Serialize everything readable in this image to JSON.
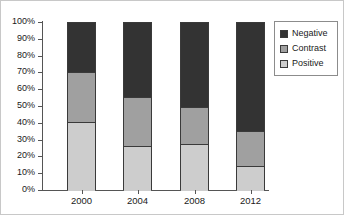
{
  "chart_data": {
    "type": "bar",
    "subtype": "stacked-percentage-column",
    "title": "",
    "subtitle": "",
    "xlabel": "",
    "ylabel": "",
    "categories": [
      "2000",
      "2004",
      "2008",
      "2012"
    ],
    "series": [
      {
        "name": "Positive",
        "color": "#cdcdcd",
        "values": [
          41,
          27,
          28,
          15
        ]
      },
      {
        "name": "Contrast",
        "color": "#a0a0a0",
        "values": [
          30,
          29,
          22,
          21
        ]
      },
      {
        "name": "Negative",
        "color": "#333333",
        "values": [
          29,
          44,
          50,
          64
        ]
      }
    ],
    "stack_order_bottom_to_top": [
      "Positive",
      "Contrast",
      "Negative"
    ],
    "cumulative_tops": {
      "2000": {
        "Positive": 41,
        "Contrast": 71,
        "Negative": 100
      },
      "2004": {
        "Positive": 27,
        "Contrast": 56,
        "Negative": 100
      },
      "2008": {
        "Positive": 28,
        "Contrast": 50,
        "Negative": 100
      },
      "2012": {
        "Positive": 15,
        "Contrast": 36,
        "Negative": 100
      }
    },
    "ylim": [
      0,
      100
    ],
    "ytick_values": [
      0,
      10,
      20,
      30,
      40,
      50,
      60,
      70,
      80,
      90,
      100
    ],
    "ytick_labels": [
      "0%",
      "10%",
      "20%",
      "30%",
      "40%",
      "50%",
      "60%",
      "70%",
      "80%",
      "90%",
      "100%"
    ],
    "grid": false,
    "legend_position": "right",
    "legend_entries": [
      "Negative",
      "Contrast",
      "Positive"
    ]
  },
  "legend": {
    "items": [
      {
        "label": "Negative",
        "color": "#333333"
      },
      {
        "label": "Contrast",
        "color": "#a0a0a0"
      },
      {
        "label": "Positive",
        "color": "#cdcdcd"
      }
    ]
  },
  "colors": {
    "negative": "#333333",
    "contrast": "#a0a0a0",
    "positive": "#cdcdcd",
    "axis": "#555555",
    "outline": "#3a3a3a",
    "frame": "#c8c8c8",
    "text": "#1a1a1a"
  }
}
